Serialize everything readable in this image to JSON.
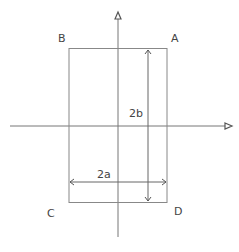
{
  "diagram": {
    "labels": {
      "corner_a": "A",
      "corner_b": "B",
      "corner_c": "C",
      "corner_d": "D",
      "height": "2b",
      "width": "2a"
    },
    "colors": {
      "line": "#777777",
      "text": "#444444"
    }
  }
}
